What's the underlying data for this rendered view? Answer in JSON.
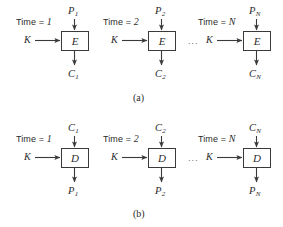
{
  "figure": {
    "ink_color": "#2b2b2b",
    "line_color": "#3a3a3a",
    "background": "#ffffff"
  },
  "panels": [
    {
      "id": "a",
      "caption": "(a)",
      "operation": "encryption",
      "box_glyph": "E",
      "ellipsis": "...",
      "stages": [
        {
          "time_prefix": "Time = ",
          "time_value": "1",
          "key_label": "K",
          "input_label": "P",
          "input_sub": "1",
          "output_label": "C",
          "output_sub": "1"
        },
        {
          "time_prefix": "Time = ",
          "time_value": "2",
          "key_label": "K",
          "input_label": "P",
          "input_sub": "2",
          "output_label": "C",
          "output_sub": "2"
        },
        {
          "time_prefix": "Time = ",
          "time_value": "N",
          "key_label": "K",
          "input_label": "P",
          "input_sub": "N",
          "output_label": "C",
          "output_sub": "N"
        }
      ]
    },
    {
      "id": "b",
      "caption": "(b)",
      "operation": "decryption",
      "box_glyph": "D",
      "ellipsis": "...",
      "stages": [
        {
          "time_prefix": "Time = ",
          "time_value": "1",
          "key_label": "K",
          "input_label": "C",
          "input_sub": "1",
          "output_label": "P",
          "output_sub": "1"
        },
        {
          "time_prefix": "Time = ",
          "time_value": "2",
          "key_label": "K",
          "input_label": "C",
          "input_sub": "2",
          "output_label": "P",
          "output_sub": "2"
        },
        {
          "time_prefix": "Time = ",
          "time_value": "N",
          "key_label": "K",
          "input_label": "C",
          "input_sub": "N",
          "output_label": "P",
          "output_sub": "N"
        }
      ]
    }
  ]
}
